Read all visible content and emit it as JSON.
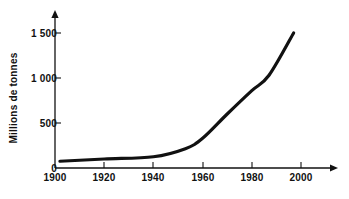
{
  "chart_data": {
    "type": "line",
    "title": "",
    "subtitle": "",
    "xlabel": "",
    "ylabel": "Millions de tonnes",
    "xlim": [
      1900,
      2010
    ],
    "ylim": [
      0,
      1600
    ],
    "grid": false,
    "legend": null,
    "x_ticks": [
      1900,
      1920,
      1940,
      1960,
      1980,
      2000
    ],
    "x_tick_labels": [
      "1900",
      "1920",
      "1940",
      "1960",
      "1980",
      "2000"
    ],
    "y_ticks": [
      0,
      500,
      1000,
      1500
    ],
    "y_tick_labels": [
      "0",
      "500",
      "1 000",
      "1 500"
    ],
    "series": [
      {
        "name": "Production",
        "color": "#111111",
        "x": [
          1902,
          1920,
          1940,
          1953,
          1960,
          1970,
          1980,
          1987,
          1997
        ],
        "values": [
          75,
          100,
          125,
          215,
          330,
          600,
          860,
          1030,
          1500
        ]
      }
    ],
    "annotations": []
  },
  "axes": {
    "x_axis_name": "years-axis",
    "y_axis_name": "millions-de-tonnes-axis",
    "axis_color": "#111111",
    "line_color": "#111111"
  }
}
